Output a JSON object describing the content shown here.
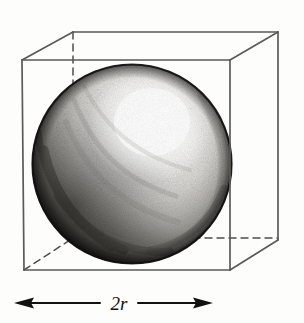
{
  "figure": {
    "caption_label": "2r",
    "background_color": "#fdfdfc"
  },
  "dimension_annotation": {
    "label": "2r",
    "meaning": "diameter equals two times the radius",
    "arrow_style": "double-headed",
    "arrow_color": "#111111",
    "left_tip_x": 14,
    "right_tip_x": 213,
    "baseline_y": 303
  },
  "cube": {
    "name": "wireframe-cube",
    "edge_color": "#5a5a58",
    "hidden_edge_style": "dashed",
    "front_face": {
      "top_left": [
        22,
        60
      ],
      "top_right": [
        230,
        60
      ],
      "bottom_right": [
        230,
        270
      ],
      "bottom_left": [
        24,
        270
      ]
    },
    "back_face": {
      "top_left": [
        73,
        32
      ],
      "top_right": [
        278,
        32
      ],
      "bottom_right": [
        278,
        240
      ],
      "bottom_left": [
        73,
        238
      ]
    },
    "visible_edges": 9,
    "hidden_edges": 3
  },
  "sphere": {
    "name": "shaded-sphere",
    "center": [
      132,
      164
    ],
    "radius": 100,
    "render_style": "pencil-shaded",
    "highlight_center": [
      150,
      125
    ],
    "highlight_color": "#ffffff",
    "midtone_color": "#9a9894",
    "shadow_color": "#2a2826",
    "rim_color": "#141312"
  },
  "icons": {
    "arrow_left": "arrow-left-icon",
    "arrow_right": "arrow-right-icon"
  }
}
